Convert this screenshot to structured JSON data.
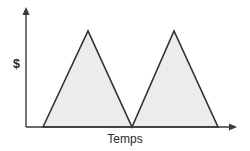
{
  "figure": {
    "background_color": "#ffffff",
    "width": 250,
    "height": 151
  },
  "axes": {
    "y_label": "$",
    "x_label": "Temps",
    "axis_color": "#3a3a3a",
    "y_axis_has_arrow": true,
    "x_axis_has_arrow": true,
    "origin_px": [
      26,
      127
    ],
    "y_axis_top_px": 8,
    "x_axis_right_px": 237
  },
  "style": {
    "fill_color": "#ececec",
    "stroke_color": "#333333",
    "stroke_width": 1.6,
    "label_color": "#2b2b2b"
  },
  "chart_data": {
    "type": "area",
    "title": "",
    "subtitle": "",
    "xlabel": "Temps",
    "ylabel": "$",
    "grid": false,
    "legend": null,
    "xlim": [
      0,
      10
    ],
    "ylim": [
      0,
      1
    ],
    "axis_ticks": {
      "x": [],
      "y": []
    },
    "annotations": [],
    "series": [
      {
        "name": "Sawtooth",
        "x": [
          0.9,
          3.2,
          5.4,
          7.5,
          9.7
        ],
        "y": [
          0,
          1,
          0,
          1,
          0
        ],
        "fill": true,
        "description": "Two successive triangular (sawtooth) pulses rising from the baseline to a peak and falling back to the baseline"
      }
    ],
    "geometry_px": {
      "baseline_y": 127,
      "peak_y": 31,
      "points": [
        [
          43,
          127
        ],
        [
          88,
          31
        ],
        [
          132,
          127
        ],
        [
          174,
          31
        ],
        [
          218,
          127
        ]
      ]
    }
  }
}
